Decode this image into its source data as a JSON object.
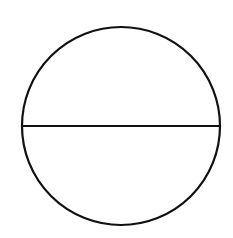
{
  "diagram": {
    "type": "circle-with-diameter",
    "canvas": {
      "width": 233,
      "height": 238,
      "background": "#ffffff"
    },
    "circle": {
      "cx": 121,
      "cy": 126,
      "r": 99,
      "stroke": "#111111",
      "stroke_width": 2.2,
      "fill": "none"
    },
    "diameter": {
      "x1": 22,
      "y1": 126,
      "x2": 220,
      "y2": 126,
      "stroke": "#111111",
      "stroke_width": 1.8
    }
  }
}
